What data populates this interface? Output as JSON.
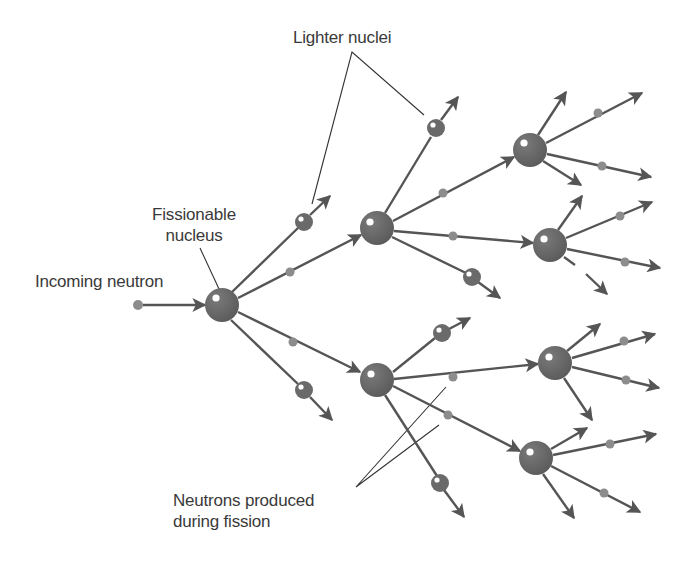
{
  "labels": {
    "lighter_nuclei": "Lighter nuclei",
    "fissionable_nucleus_line1": "Fissionable",
    "fissionable_nucleus_line2": "nucleus",
    "incoming_neutron": "Incoming neutron",
    "neutrons_produced_line1": "Neutrons produced",
    "neutrons_produced_line2": "during fission"
  },
  "colors": {
    "background": "#ffffff",
    "particle": "#6a6a6a",
    "neutron": "#8c8c8c",
    "arrow": "#555555",
    "leader_line": "#333333",
    "text": "#3a3a3a",
    "highlight": "#ffffff"
  },
  "nodes": {
    "incoming_neutron": {
      "x": 138,
      "y": 305,
      "r": 5
    },
    "generations": [
      {
        "name": "generation-1",
        "nuclei": [
          {
            "id": "A",
            "x": 222,
            "y": 305,
            "r": 17
          }
        ]
      },
      {
        "name": "generation-2",
        "nuclei": [
          {
            "id": "B",
            "x": 377,
            "y": 228,
            "r": 17
          },
          {
            "id": "C",
            "x": 377,
            "y": 380,
            "r": 17
          }
        ]
      },
      {
        "name": "generation-3",
        "nuclei": [
          {
            "id": "D",
            "x": 530,
            "y": 150,
            "r": 17
          },
          {
            "id": "E",
            "x": 550,
            "y": 245,
            "r": 17
          },
          {
            "id": "F",
            "x": 555,
            "y": 363,
            "r": 17
          },
          {
            "id": "G",
            "x": 536,
            "y": 458,
            "r": 17
          }
        ]
      }
    ]
  }
}
